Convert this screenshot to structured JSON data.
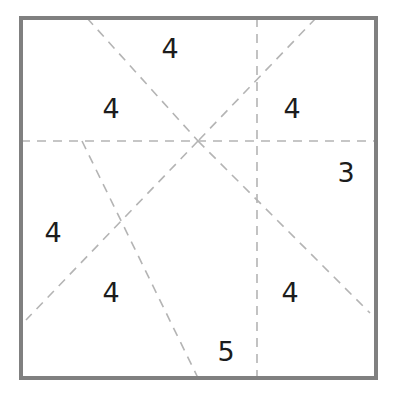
{
  "figure": {
    "width": 396,
    "height": 398,
    "background_color": "#ffffff",
    "frame": {
      "name": "outer-square-border",
      "x": 21,
      "y": 18,
      "width": 355,
      "height": 360,
      "stroke_color": "#808080",
      "stroke_width": 4,
      "style": "solid"
    },
    "dash": {
      "stroke_color": "#b4b4b4",
      "stroke_width": 1.6,
      "pattern": "9 7"
    },
    "lines": [
      {
        "name": "horizontal-midline",
        "orientation": "horizontal",
        "x1": 21,
        "y1": 141,
        "x2": 376,
        "y2": 141
      },
      {
        "name": "vertical-right-line",
        "orientation": "vertical",
        "x1": 257,
        "y1": 18,
        "x2": 257,
        "y2": 378
      },
      {
        "name": "diagonal-top-left-to-center",
        "orientation": "diagonal",
        "x1": 87,
        "y1": 18,
        "x2": 198,
        "y2": 141
      },
      {
        "name": "diagonal-center-to-bottom-right",
        "orientation": "diagonal",
        "x1": 198,
        "y1": 141,
        "x2": 370,
        "y2": 313
      },
      {
        "name": "diagonal-top-right-to-center",
        "orientation": "diagonal",
        "x1": 316,
        "y1": 18,
        "x2": 198,
        "y2": 141
      },
      {
        "name": "diagonal-center-to-bottom-left",
        "orientation": "diagonal",
        "x1": 198,
        "y1": 141,
        "x2": 26,
        "y2": 320
      },
      {
        "name": "steep-diagonal-midline-to-bottom",
        "orientation": "diagonal",
        "x1": 82,
        "y1": 141,
        "x2": 198,
        "y2": 378
      }
    ],
    "intersections": [
      {
        "name": "center-hub",
        "x": 198,
        "y": 141
      },
      {
        "name": "lower-left-crossing",
        "x": 123,
        "y": 227
      }
    ],
    "labels": [
      {
        "name": "label-top-center",
        "value": "4",
        "x": 170,
        "y": 48
      },
      {
        "name": "label-upper-left",
        "value": "4",
        "x": 111,
        "y": 108
      },
      {
        "name": "label-upper-right",
        "value": "4",
        "x": 292,
        "y": 108
      },
      {
        "name": "label-right",
        "value": "3",
        "x": 346,
        "y": 172
      },
      {
        "name": "label-left",
        "value": "4",
        "x": 53,
        "y": 232
      },
      {
        "name": "label-lower-left",
        "value": "4",
        "x": 111,
        "y": 292
      },
      {
        "name": "label-lower-right",
        "value": "4",
        "x": 290,
        "y": 292
      },
      {
        "name": "label-bottom",
        "value": "5",
        "x": 226,
        "y": 351
      }
    ]
  }
}
